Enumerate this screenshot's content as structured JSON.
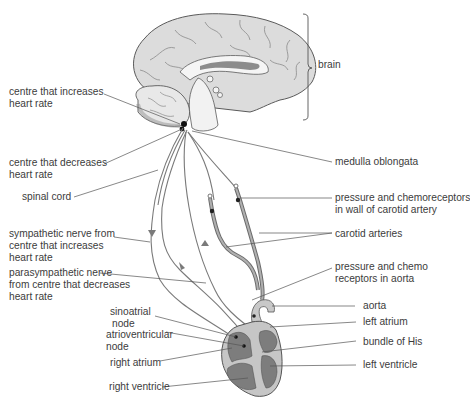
{
  "diagram": {
    "labels": {
      "brain": "brain",
      "centre_increases_1": "centre that increases",
      "centre_increases_2": "heart rate",
      "centre_decreases_1": "centre that decreases",
      "centre_decreases_2": "heart rate",
      "spinal_cord": "spinal cord",
      "sympathetic_1": "sympathetic nerve from",
      "sympathetic_2": "centre that increases",
      "sympathetic_3": "heart rate",
      "parasympathetic_1": "parasympathetic nerve",
      "parasympathetic_2": "from centre that decreases",
      "parasympathetic_3": "heart rate",
      "sinoatrial_1": "sinoatrial",
      "sinoatrial_2": "node",
      "atrioventricular_1": "atrioventricular",
      "atrioventricular_2": "node",
      "right_atrium": "right atrium",
      "right_ventricle": "right ventricle",
      "medulla": "medulla oblongata",
      "carotid_receptors_1": "pressure and chemoreceptors",
      "carotid_receptors_2": "in wall of carotid artery",
      "carotid_arteries": "carotid arteries",
      "aorta_receptors_1": "pressure and chemo",
      "aorta_receptors_2": "receptors in aorta",
      "aorta": "aorta",
      "left_atrium": "left atrium",
      "bundle_of_his": "bundle of His",
      "left_ventricle": "left ventricle"
    },
    "colors": {
      "brain_fill": "#d9d9d9",
      "brain_outline": "#5a5a5a",
      "nerve": "#7a7a7a",
      "heart_chamber": "#7d7d7d",
      "heart_wall": "#c8c8c8",
      "leader_line": "#555555",
      "text": "#3c3c3c"
    }
  }
}
